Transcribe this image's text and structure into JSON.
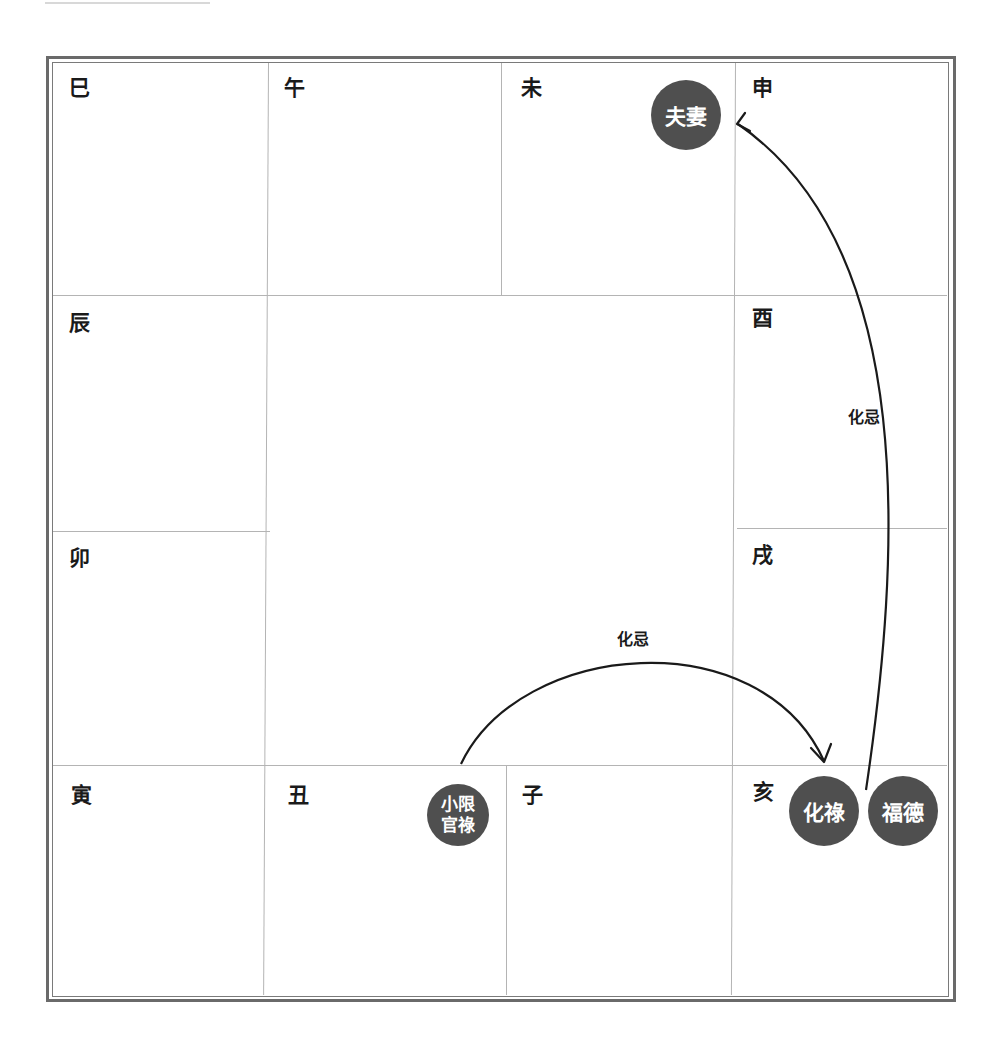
{
  "chart": {
    "type": "ziwei-palace-grid",
    "branches": {
      "si": "巳",
      "wu": "午",
      "wei": "未",
      "shen": "申",
      "chen": "辰",
      "you": "酉",
      "mao": "卯",
      "xu": "戌",
      "yin": "寅",
      "chou": "丑",
      "zi": "子",
      "hai": "亥"
    },
    "badges": {
      "wei_palace": "夫妻",
      "chou_line1": "小限",
      "chou_line2": "官祿",
      "hai_hualu": "化祿",
      "hai_fude": "福德"
    },
    "arrows": [
      {
        "from": "丑 小限官祿",
        "to": "亥 化祿",
        "label": "化忌"
      },
      {
        "from": "亥 福德",
        "to": "申",
        "label": "化忌"
      }
    ],
    "colors": {
      "badge_fill": "#4f4f4f",
      "badge_text": "#ffffff",
      "grid_line": "#b4b4b4",
      "frame": "#6a6a6a",
      "text": "#1a1a1a"
    }
  }
}
